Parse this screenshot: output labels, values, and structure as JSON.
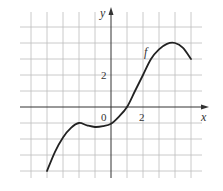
{
  "chart_data": {
    "type": "line",
    "title": "",
    "xlabel": "x",
    "ylabel": "y",
    "curve_label": "f",
    "tick_labels": {
      "origin": "0",
      "x": [
        "2"
      ],
      "y": [
        "2"
      ]
    },
    "xlim": [
      -5,
      5
    ],
    "ylim": [
      -4,
      5
    ],
    "grid": true,
    "grid_step": 1,
    "series": [
      {
        "name": "f",
        "x": [
          -4,
          -3.5,
          -3,
          -2.5,
          -2,
          -1.5,
          -1,
          -0.5,
          0,
          0.5,
          1,
          1.5,
          2,
          2.5,
          3,
          3.5,
          4,
          4.5,
          5
        ],
        "y": [
          -4,
          -2.8,
          -1.9,
          -1.3,
          -1,
          -1.15,
          -1.25,
          -1.2,
          -1.05,
          -0.6,
          0,
          1,
          2,
          3,
          3.6,
          3.95,
          4,
          3.7,
          3
        ]
      }
    ],
    "colors": {
      "grid": "#bdbdbd",
      "axes": "#333333",
      "curve": "#222222"
    }
  }
}
